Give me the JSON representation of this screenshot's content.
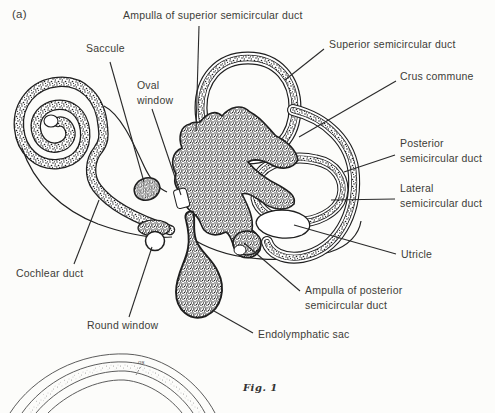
{
  "figure": {
    "panel_tag": "(a)",
    "caption": "Fig. 1",
    "inset_label": "os"
  },
  "labels": {
    "ampulla_superior": "Ampulla of superior semicircular duct",
    "saccule": "Saccule",
    "oval_window": "Oval window",
    "superior_duct": "Superior semicircular duct",
    "crus_commune": "Crus commune",
    "posterior_duct": "Posterior semicircular duct",
    "lateral_duct": "Lateral semicircular duct",
    "utricle": "Utricle",
    "cochlear_duct": "Cochlear duct",
    "round_window": "Round window",
    "ampulla_posterior": "Ampulla of posterior semicircular duct",
    "endolymphatic_sac": "Endolymphatic sac"
  },
  "colors": {
    "ink": "#1f1f1f",
    "text": "#3d3d38",
    "background": "#fcfcfa",
    "inset_line": "#4a4a4a"
  }
}
